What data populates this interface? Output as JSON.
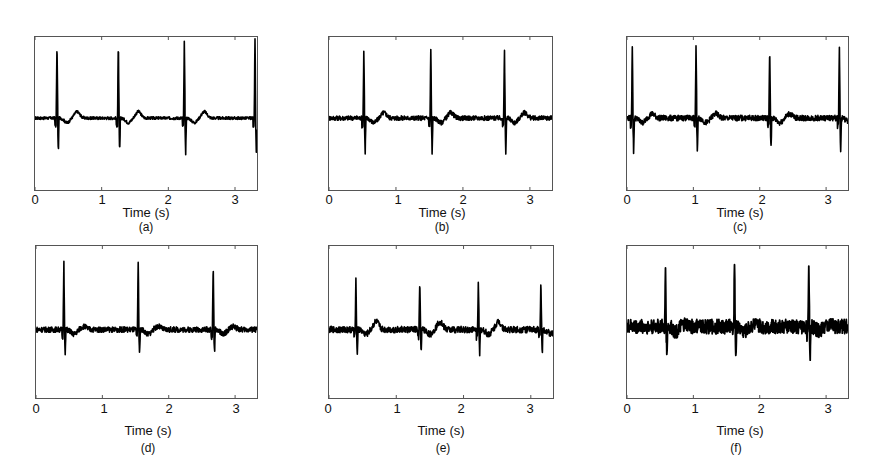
{
  "figure": {
    "x_tick_labels": [
      "0",
      "1",
      "2",
      "3"
    ],
    "xlabel": "Time (s)"
  },
  "chart_data": [
    {
      "type": "line",
      "panel": "(a)",
      "title": "",
      "xlabel": "Time (s)",
      "ylabel": "",
      "xlim": [
        0,
        3.33
      ],
      "x_ticks": [
        0,
        1,
        2,
        3
      ],
      "y_ticks": [],
      "grid": false,
      "legend": null,
      "description": "ECG-like signal with sharp QRS spikes; low noise baseline with small T-waves",
      "r_peak_times_s": [
        0.33,
        1.25,
        2.24,
        3.3
      ],
      "spike_up": 0.85,
      "spike_down": 0.42,
      "noise_level": 0.03,
      "t_wave": 0.12,
      "baseline_frac": 0.53
    },
    {
      "type": "line",
      "panel": "(b)",
      "title": "",
      "xlabel": "Time (s)",
      "ylabel": "",
      "xlim": [
        0,
        3.33
      ],
      "x_ticks": [
        0,
        1,
        2,
        3
      ],
      "y_ticks": [],
      "grid": false,
      "legend": null,
      "description": "ECG-like signal with three QRS spikes; slightly noisier baseline",
      "r_peak_times_s": [
        0.52,
        1.52,
        2.62
      ],
      "spike_up": 0.75,
      "spike_down": 0.42,
      "noise_level": 0.05,
      "t_wave": 0.1,
      "baseline_frac": 0.53
    },
    {
      "type": "line",
      "panel": "(c)",
      "title": "",
      "xlabel": "Time (s)",
      "ylabel": "",
      "xlim": [
        0,
        3.33
      ],
      "x_ticks": [
        0,
        1,
        2,
        3
      ],
      "y_ticks": [],
      "grid": false,
      "legend": null,
      "description": "ECG-like signal with four QRS spikes; moderate noise",
      "r_peak_times_s": [
        0.08,
        1.04,
        2.15,
        3.2
      ],
      "spike_up": 0.8,
      "spike_down": 0.4,
      "noise_level": 0.06,
      "t_wave": 0.08,
      "baseline_frac": 0.53
    },
    {
      "type": "line",
      "panel": "(d)",
      "title": "",
      "xlabel": "Time (s)",
      "ylabel": "",
      "xlim": [
        0,
        3.33
      ],
      "x_ticks": [
        0,
        1,
        2,
        3
      ],
      "y_ticks": [],
      "grid": false,
      "legend": null,
      "description": "ECG-like signal with three QRS spikes; noisy baseline",
      "r_peak_times_s": [
        0.42,
        1.54,
        2.67
      ],
      "spike_up": 0.75,
      "spike_down": 0.3,
      "noise_level": 0.06,
      "t_wave": 0.06,
      "baseline_frac": 0.55
    },
    {
      "type": "line",
      "panel": "(e)",
      "title": "",
      "xlabel": "Time (s)",
      "ylabel": "",
      "xlim": [
        0,
        3.33
      ],
      "x_ticks": [
        0,
        1,
        2,
        3
      ],
      "y_ticks": [],
      "grid": false,
      "legend": null,
      "description": "ECG-like signal with four QRS spikes; noisy baseline with visible T-waves",
      "r_peak_times_s": [
        0.4,
        1.35,
        2.22,
        3.15
      ],
      "spike_up": 0.55,
      "spike_down": 0.3,
      "noise_level": 0.07,
      "t_wave": 0.15,
      "baseline_frac": 0.55
    },
    {
      "type": "line",
      "panel": "(f)",
      "title": "",
      "xlabel": "Time (s)",
      "ylabel": "",
      "xlim": [
        0,
        3.33
      ],
      "x_ticks": [
        0,
        1,
        2,
        3
      ],
      "y_ticks": [],
      "grid": false,
      "legend": null,
      "description": "ECG-like signal with three QRS spikes; heavy noise on baseline",
      "r_peak_times_s": [
        0.58,
        1.62,
        2.74
      ],
      "spike_up": 0.65,
      "spike_down": 0.35,
      "noise_level": 0.16,
      "t_wave": 0.04,
      "baseline_frac": 0.53
    }
  ],
  "panels": [
    {
      "caption": "(a)"
    },
    {
      "caption": "(b)"
    },
    {
      "caption": "(c)"
    },
    {
      "caption": "(d)"
    },
    {
      "caption": "(e)"
    },
    {
      "caption": "(f)"
    }
  ]
}
